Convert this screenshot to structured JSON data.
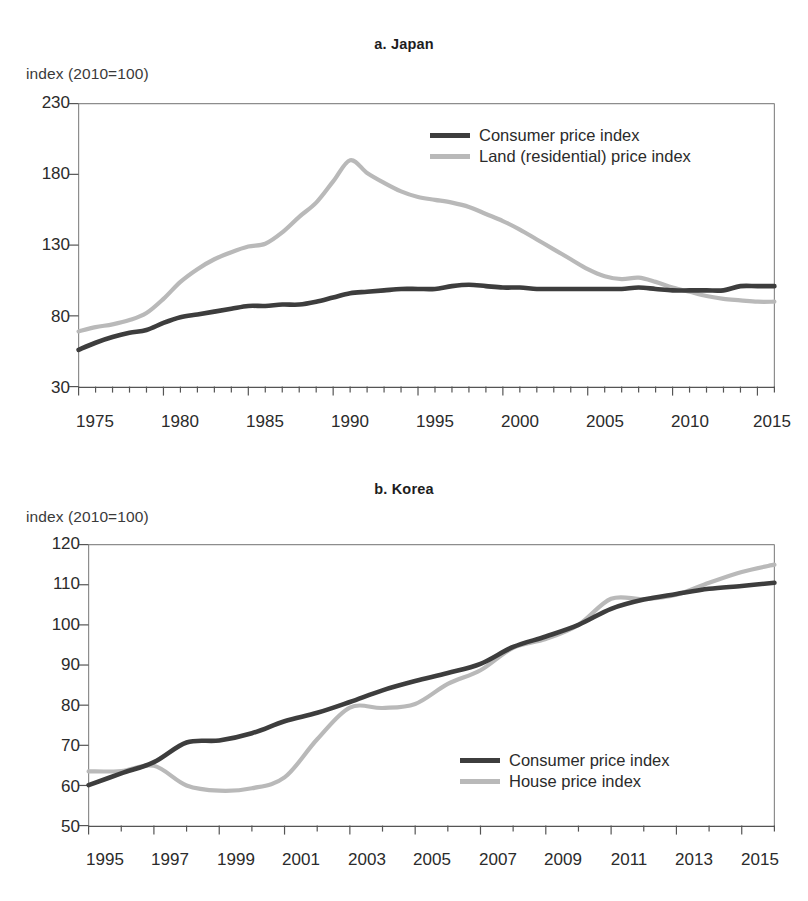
{
  "figure": {
    "background_color": "#ffffff",
    "series_colors": {
      "dark": "#3d3d3d",
      "light": "#b9b9b9"
    }
  },
  "panels": [
    {
      "id": "japan",
      "title": "a. Japan",
      "axis_unit": "index (2010=100)",
      "legend_position": "top-right",
      "legend": [
        {
          "label": "Consumer price index",
          "color_key": "dark"
        },
        {
          "label": "Land (residential) price index",
          "color_key": "light"
        }
      ],
      "y_tick_labels": [
        "230",
        "180",
        "130",
        "80",
        "30"
      ],
      "x_tick_labels": [
        "1975",
        "1980",
        "1985",
        "1990",
        "1995",
        "2000",
        "2005",
        "2010",
        "2015"
      ]
    },
    {
      "id": "korea",
      "title": "b. Korea",
      "axis_unit": "index (2010=100)",
      "legend_position": "bottom-right",
      "legend": [
        {
          "label": "Consumer price index",
          "color_key": "dark"
        },
        {
          "label": "House price index",
          "color_key": "light"
        }
      ],
      "y_tick_labels": [
        "120",
        "110",
        "100",
        "90",
        "80",
        "70",
        "60",
        "50"
      ],
      "x_tick_labels": [
        "1995",
        "1997",
        "1999",
        "2001",
        "2003",
        "2005",
        "2007",
        "2009",
        "2011",
        "2013",
        "2015"
      ]
    }
  ],
  "chart_data": [
    {
      "type": "line",
      "title": "a. Japan",
      "xlabel": "",
      "ylabel": "index (2010=100)",
      "xlim": [
        1975,
        2016
      ],
      "ylim": [
        30,
        230
      ],
      "y_ticks": [
        30,
        80,
        130,
        180,
        230
      ],
      "x_ticks": [
        1975,
        1980,
        1985,
        1990,
        1995,
        2000,
        2005,
        2010,
        2015
      ],
      "x_minor_tick_interval": 1,
      "grid": false,
      "legend_position": "upper right",
      "x": [
        1975,
        1976,
        1977,
        1978,
        1979,
        1980,
        1981,
        1982,
        1983,
        1984,
        1985,
        1986,
        1987,
        1988,
        1989,
        1990,
        1991,
        1992,
        1993,
        1994,
        1995,
        1996,
        1997,
        1998,
        1999,
        2000,
        2001,
        2002,
        2003,
        2004,
        2005,
        2006,
        2007,
        2008,
        2009,
        2010,
        2011,
        2012,
        2013,
        2014,
        2015,
        2016
      ],
      "series": [
        {
          "name": "Consumer price index",
          "color_key": "dark",
          "values": [
            56,
            61,
            65,
            68,
            70,
            75,
            79,
            81,
            83,
            85,
            87,
            87,
            88,
            88,
            90,
            93,
            96,
            97,
            98,
            99,
            99,
            99,
            101,
            102,
            101,
            100,
            100,
            99,
            99,
            99,
            99,
            99,
            99,
            100,
            99,
            98,
            98,
            98,
            98,
            101,
            101,
            101
          ],
          "unit": "index (2010=100)"
        },
        {
          "name": "Land (residential) price index",
          "color_key": "light",
          "values": [
            69,
            72,
            74,
            77,
            82,
            92,
            104,
            113,
            120,
            125,
            129,
            131,
            139,
            150,
            160,
            175,
            190,
            181,
            174,
            168,
            164,
            162,
            160,
            157,
            152,
            147,
            141,
            134,
            127,
            120,
            113,
            108,
            106,
            107,
            104,
            100,
            97,
            94,
            92,
            91,
            90,
            90
          ],
          "unit": "index (2010=100)"
        }
      ]
    },
    {
      "type": "line",
      "title": "b. Korea",
      "xlabel": "",
      "ylabel": "index (2010=100)",
      "xlim": [
        1995,
        2016
      ],
      "ylim": [
        50,
        120
      ],
      "y_ticks": [
        50,
        60,
        70,
        80,
        90,
        100,
        110,
        120
      ],
      "x_ticks": [
        1995,
        1997,
        1999,
        2001,
        2003,
        2005,
        2007,
        2009,
        2011,
        2013,
        2015
      ],
      "x_minor_tick_interval": 1,
      "grid": false,
      "legend_position": "lower right",
      "x": [
        1995,
        1996,
        1997,
        1998,
        1999,
        2000,
        2001,
        2002,
        2003,
        2004,
        2005,
        2006,
        2007,
        2008,
        2009,
        2010,
        2011,
        2012,
        2013,
        2014,
        2015,
        2016
      ],
      "series": [
        {
          "name": "Consumer price index",
          "color_key": "dark",
          "values": [
            60.1,
            63.0,
            65.8,
            70.7,
            71.2,
            73.0,
            76.0,
            78.1,
            80.8,
            83.7,
            86.0,
            88.0,
            90.3,
            94.5,
            97.1,
            100.0,
            104.0,
            106.3,
            107.7,
            109.0,
            109.7,
            110.5
          ],
          "unit": "index (2010=100)"
        },
        {
          "name": "House price index",
          "color_key": "light",
          "values": [
            63.5,
            63.6,
            64.9,
            60.0,
            58.7,
            59.3,
            62.0,
            71.5,
            79.4,
            79.3,
            80.3,
            85.3,
            88.7,
            94.3,
            96.5,
            100.0,
            106.5,
            106.4,
            107.5,
            110.5,
            113.2,
            115.0
          ],
          "unit": "index (2010=100)"
        }
      ]
    }
  ]
}
